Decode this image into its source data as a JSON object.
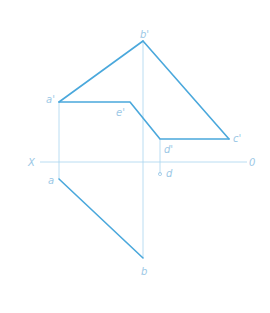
{
  "colors": {
    "thick_line": "#4aa8dc",
    "thin_line": "#a8d4ef",
    "label": "#9cc8e6",
    "background": "#ffffff"
  },
  "axis": {
    "left_label": "X",
    "right_label": "0"
  },
  "front_view": {
    "labels": {
      "a_prime": "a'",
      "b_prime": "b'",
      "c_prime": "c'",
      "d_prime": "d'",
      "e_prime": "e'"
    }
  },
  "top_view": {
    "labels": {
      "a": "a",
      "b": "b",
      "d": "d"
    }
  }
}
